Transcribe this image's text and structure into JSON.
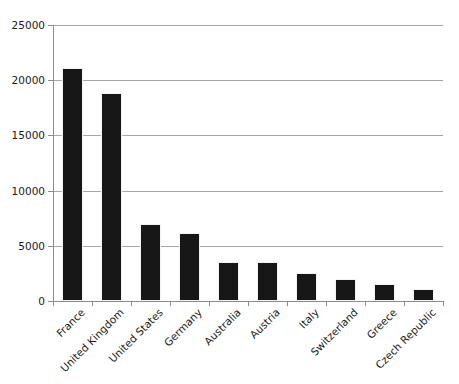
{
  "chart_data": {
    "type": "bar",
    "title": "",
    "subtitle": "",
    "xlabel": "",
    "ylabel": "",
    "ylim": [
      0,
      25000
    ],
    "ytick_step": 5000,
    "yticks": [
      "0",
      "5000",
      "10000",
      "15000",
      "20000",
      "25000"
    ],
    "ytick_values": [
      0,
      5000,
      10000,
      15000,
      20000,
      25000
    ],
    "grid": "horizontal",
    "legend": "none",
    "orientation": "vertical",
    "bar_color": "#171717",
    "grid_color": "#a6a6a6",
    "axis_color": "#8c8c8c",
    "background": "#ffffff",
    "xtick_label_rotation": -45,
    "categories": [
      "France",
      "United Kingdom",
      "United States",
      "Germany",
      "Australia",
      "Austria",
      "Italy",
      "Switzerland",
      "Greece",
      "Czech Republic"
    ],
    "values": [
      21100,
      18800,
      7000,
      6200,
      3500,
      3500,
      2500,
      2000,
      1500,
      1100
    ],
    "series": [
      {
        "name": "",
        "values": [
          21100,
          18800,
          7000,
          6200,
          3500,
          3500,
          2500,
          2000,
          1500,
          1100
        ]
      }
    ]
  }
}
